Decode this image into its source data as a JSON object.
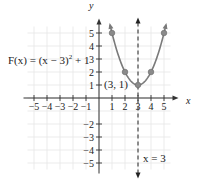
{
  "chart_data": {
    "type": "line",
    "title": "",
    "xlabel": "x",
    "ylabel": "y",
    "xlim": [
      -5.5,
      5.5
    ],
    "ylim": [
      -5.5,
      5.5
    ],
    "grid": true,
    "x_ticks": [
      -5,
      -4,
      -3,
      -2,
      -1,
      1,
      2,
      3,
      4,
      5
    ],
    "x_tick_labels": [
      "−5",
      "−4",
      "−3",
      "−2",
      "−1",
      "1",
      "2",
      "3",
      "4",
      "5"
    ],
    "y_ticks": [
      5,
      4,
      3,
      2,
      1,
      -2,
      -3,
      -4,
      -5
    ],
    "y_tick_labels": [
      "5",
      "4",
      "3",
      "2",
      "1",
      "−2",
      "−3",
      "−4",
      "−5"
    ],
    "series": [
      {
        "name": "F(x) = (x − 3)² + 1",
        "function": "(x-3)^2+1",
        "x_range": [
          0.85,
          5.15
        ],
        "color": "#7a7a7a",
        "points": [
          {
            "x": 1,
            "y": 5
          },
          {
            "x": 2,
            "y": 2
          },
          {
            "x": 3,
            "y": 1
          },
          {
            "x": 4,
            "y": 2
          },
          {
            "x": 5,
            "y": 5
          }
        ]
      }
    ],
    "axis_of_symmetry": {
      "x": 3,
      "label": "x = 3",
      "style": "dashed"
    },
    "annotations": [
      {
        "text": "(3, 1)",
        "x": 3,
        "y": 1,
        "target": "vertex"
      },
      {
        "text": "F(x) = (x − 3)² + 1",
        "target": "curve-label"
      }
    ]
  },
  "labels": {
    "equation_main": "F(x) = (x − 3)",
    "equation_exp": "2",
    "equation_tail": " + 1",
    "vertex": "(3, 1)",
    "symmetry": "x = 3",
    "x_axis": "x",
    "y_axis": "y"
  }
}
